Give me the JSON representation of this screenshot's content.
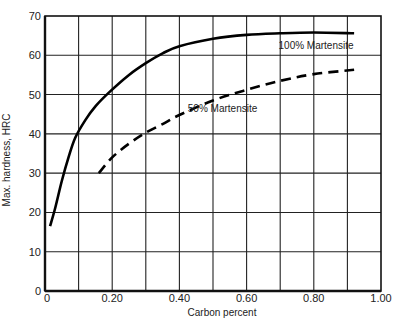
{
  "chart_data": {
    "type": "line",
    "title": "",
    "xlabel": "Carbon percent",
    "ylabel": "Max. hardness, HRC",
    "xlim": [
      0,
      1.0
    ],
    "ylim": [
      0,
      70
    ],
    "grid": true,
    "x_gridlines": [
      0.1,
      0.2,
      0.3,
      0.4,
      0.5,
      0.6,
      0.7,
      0.8,
      0.9
    ],
    "y_gridlines": [
      10,
      20,
      30,
      40,
      50,
      60
    ],
    "x_ticks": [
      {
        "value": 0,
        "label": "0"
      },
      {
        "value": 0.2,
        "label": "0.20"
      },
      {
        "value": 0.4,
        "label": "0.40"
      },
      {
        "value": 0.6,
        "label": "0.60"
      },
      {
        "value": 0.8,
        "label": "0.80"
      },
      {
        "value": 1.0,
        "label": "1.00"
      }
    ],
    "y_ticks": [
      {
        "value": 0,
        "label": "0"
      },
      {
        "value": 10,
        "label": "10"
      },
      {
        "value": 20,
        "label": "20"
      },
      {
        "value": 30,
        "label": "30"
      },
      {
        "value": 40,
        "label": "40"
      },
      {
        "value": 50,
        "label": "50"
      },
      {
        "value": 60,
        "label": "60"
      },
      {
        "value": 70,
        "label": "70"
      }
    ],
    "series": [
      {
        "name": "100% Martensite",
        "style": "solid",
        "color": "#000000",
        "label_pos": {
          "x": 0.695,
          "y": 61.5
        },
        "x": [
          0.015,
          0.03,
          0.05,
          0.07,
          0.09,
          0.12,
          0.15,
          0.19,
          0.25,
          0.3,
          0.35,
          0.4,
          0.5,
          0.6,
          0.7,
          0.8,
          0.92
        ],
        "y": [
          16.5,
          21,
          28,
          34,
          39,
          43.5,
          47,
          50.5,
          55,
          58,
          60.5,
          62.3,
          64.2,
          65.2,
          65.6,
          65.8,
          65.6
        ]
      },
      {
        "name": "50% Martensite",
        "style": "dashed",
        "color": "#000000",
        "label_pos": {
          "x": 0.425,
          "y": 45.5
        },
        "x": [
          0.16,
          0.2,
          0.25,
          0.3,
          0.35,
          0.4,
          0.5,
          0.6,
          0.7,
          0.8,
          0.92
        ],
        "y": [
          30,
          34,
          37.5,
          40.3,
          42.5,
          44.8,
          48.5,
          51.2,
          53.5,
          55.2,
          56.3
        ]
      }
    ]
  }
}
